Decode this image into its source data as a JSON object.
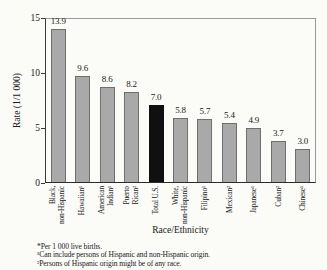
{
  "chart_data": {
    "type": "bar",
    "title": "",
    "xlabel": "Race/Ethnicity",
    "ylabel": "Rate (1/1 000)",
    "ylim": [
      0,
      15
    ],
    "yticks": [
      0,
      5,
      10,
      15
    ],
    "grid": false,
    "legend": "none",
    "categories": [
      "Black,\nnon-Hispanic",
      "Hawaiian¹",
      "American\nIndian¹",
      "Puerto\nRican²",
      "Total U.S.",
      "White,\nnon-Hispanic",
      "Filipino¹",
      "Mexican²",
      "Japanese¹",
      "Cuban²",
      "Chinese¹"
    ],
    "values": [
      13.9,
      9.6,
      8.6,
      8.2,
      7.0,
      5.8,
      5.7,
      5.4,
      4.9,
      3.7,
      3.0
    ],
    "highlight_index": 4,
    "highlight_category": "Total U.S.",
    "bar_color": "#a9a9a9",
    "highlight_color": "#101010"
  },
  "footnotes": [
    "*Per 1 000 live births.",
    "¹Can include persons of Hispanic and non-Hispanic origin.",
    "²Persons of Hispanic origin might be of any race."
  ]
}
